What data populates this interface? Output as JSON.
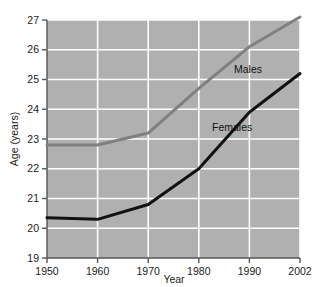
{
  "chart_data": {
    "type": "line",
    "title": "",
    "xlabel": "Year",
    "ylabel": "Age (years)",
    "x": [
      1950,
      1960,
      1970,
      1980,
      1990,
      2002
    ],
    "xtick_labels": [
      "1950",
      "1960",
      "1970",
      "1980",
      "1990",
      "2002"
    ],
    "ytick_labels": [
      "19",
      "20",
      "21",
      "22",
      "23",
      "24",
      "25",
      "26",
      "27"
    ],
    "ylim": [
      19,
      27
    ],
    "ytick_values": [
      19,
      20,
      21,
      22,
      23,
      24,
      25,
      26,
      27
    ],
    "grid": true,
    "grid_color": "#ffffff",
    "plot_background": "#b0b0b0",
    "page_background": "#ffffff",
    "legend_position": "inline-labels",
    "series": [
      {
        "name": "Males",
        "color": "#808080",
        "values": [
          22.8,
          22.8,
          23.2,
          24.7,
          26.1,
          27.1
        ],
        "label_text": "Males"
      },
      {
        "name": "Females",
        "color": "#111111",
        "values": [
          20.35,
          20.3,
          20.8,
          22.0,
          23.9,
          25.2
        ],
        "label_text": "Females"
      }
    ]
  },
  "axes": {
    "y_title": "Age (years)",
    "x_title": "Year"
  },
  "ticks": {
    "y": [
      "27",
      "26",
      "25",
      "24",
      "23",
      "22",
      "21",
      "20",
      "19"
    ],
    "x": [
      "1950",
      "1960",
      "1970",
      "1980",
      "1990",
      "2002"
    ]
  },
  "labels": {
    "males": "Males",
    "females": "Females"
  }
}
